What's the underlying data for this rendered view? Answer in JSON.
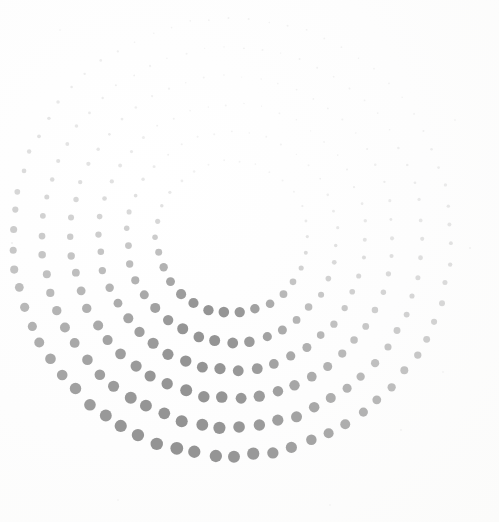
{
  "figure": {
    "type": "halftone-ring-pattern",
    "canvas": {
      "width": 499,
      "height": 522,
      "background_color": "#fdfdfd"
    },
    "ink_color": "#8a8a8a",
    "center": {
      "x": 232,
      "y": 237
    },
    "inner_hole_radius": 74,
    "outer_radius": 228,
    "ring_count": 6,
    "ring_spacing": 28.5,
    "size_gradient": {
      "description": "Dot radius and opacity peak toward the lower-left / bottom of the annulus and fade toward the upper-right / right side.",
      "max_dot_radius": 7.0,
      "min_dot_radius": 0.8,
      "max_opacity": 0.92,
      "min_opacity": 0.1,
      "bright_axis_degrees": 105,
      "faint_axis_degrees": 285
    },
    "rings": [
      {
        "index": 0,
        "radius": 76,
        "dot_count": 30,
        "angle_offset_degrees": 0,
        "base_dot_radius": 5.2
      },
      {
        "index": 1,
        "radius": 105,
        "dot_count": 38,
        "angle_offset_degrees": 4.5,
        "base_dot_radius": 5.4
      },
      {
        "index": 2,
        "radius": 133,
        "dot_count": 46,
        "angle_offset_degrees": 9.0,
        "base_dot_radius": 5.6
      },
      {
        "index": 3,
        "radius": 161,
        "dot_count": 54,
        "angle_offset_degrees": 13.5,
        "base_dot_radius": 5.8
      },
      {
        "index": 4,
        "radius": 190,
        "dot_count": 62,
        "angle_offset_degrees": 18.0,
        "base_dot_radius": 6.0
      },
      {
        "index": 5,
        "radius": 219,
        "dot_count": 70,
        "angle_offset_degrees": 22.5,
        "base_dot_radius": 6.2
      }
    ],
    "specks": [
      {
        "x": 12,
        "y": 243,
        "r": 1.2,
        "opacity": 0.22
      },
      {
        "x": 470,
        "y": 248,
        "r": 1.0,
        "opacity": 0.18
      },
      {
        "x": 401,
        "y": 430,
        "r": 1.1,
        "opacity": 0.16
      },
      {
        "x": 443,
        "y": 372,
        "r": 0.9,
        "opacity": 0.14
      },
      {
        "x": 118,
        "y": 500,
        "r": 0.9,
        "opacity": 0.12
      },
      {
        "x": 330,
        "y": 505,
        "r": 1.0,
        "opacity": 0.13
      },
      {
        "x": 60,
        "y": 30,
        "r": 0.8,
        "opacity": 0.12
      },
      {
        "x": 455,
        "y": 120,
        "r": 0.9,
        "opacity": 0.14
      }
    ]
  }
}
